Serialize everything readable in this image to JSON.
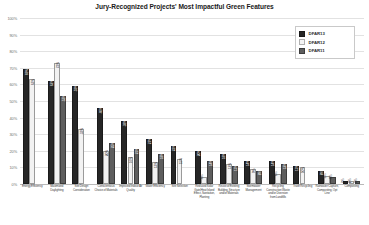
{
  "chart_data": {
    "type": "bar",
    "title": "Jury-Recognized Projects' Most Impactful Green Features",
    "xlabel": "",
    "ylabel": "",
    "ylim": [
      0,
      100
    ],
    "ytick_labels": [
      "100%",
      "90%",
      "80%",
      "70%",
      "60%",
      "50%",
      "40%",
      "30%",
      "20%",
      "10%",
      "0%"
    ],
    "ytick_values": [
      100,
      90,
      80,
      70,
      60,
      50,
      40,
      30,
      20,
      10,
      0
    ],
    "grid": true,
    "legend_position": "top-right",
    "categories": [
      "Energy Efficiency",
      "Maximized Daylighting",
      "Site Design Consideration",
      "Conscientious Choice of Materials",
      "Improved Indoor Air Quality",
      "Water Efficiency",
      "Site Selection",
      "Reduced Solar Gain/Heat Island Effect, Sanitation, Planting",
      "Reuse of Existing Building, Structure and/or Materials",
      "Stormwater Management",
      "Recycling Construction Waste and/or Diversion from Landfills",
      "Trash Recycling",
      "Rainwater Capture, Composting, Opt Line",
      "Composting"
    ],
    "series": [
      {
        "name": "DFAR13",
        "color": "#262626",
        "values": [
          69,
          62,
          59,
          46,
          38,
          27,
          23,
          20,
          18,
          14,
          14,
          11,
          8,
          2
        ],
        "labels": [
          "69%",
          "62%",
          "59%",
          "46%",
          "38%",
          "27%",
          "23%",
          "20%",
          "18%",
          "14%",
          "14%",
          "11%",
          "8%",
          "2%"
        ]
      },
      {
        "name": "DFAR12",
        "color": "#f2f2f2",
        "values": [
          63,
          73,
          33,
          20,
          16,
          13,
          15,
          4,
          12,
          9,
          6,
          10,
          5,
          2
        ],
        "labels": [
          "63%",
          "73%",
          "33%",
          "20%",
          "16%",
          "13%",
          "15%",
          "4%",
          "12%",
          "9%",
          "6%",
          "10%",
          "5%",
          "2%"
        ]
      },
      {
        "name": "DFAR11",
        "color": "#5e5e5e",
        "values": [
          0,
          53,
          0,
          25,
          21,
          18,
          0,
          14,
          11,
          8,
          12,
          0,
          4,
          2
        ],
        "labels": [
          "",
          "53%",
          "",
          "25%",
          "21%",
          "18%",
          "",
          "14%",
          "11%",
          "8%",
          "12%",
          "",
          "4%",
          "2%"
        ]
      }
    ]
  },
  "legend": {
    "items": [
      {
        "label": "DFAR13"
      },
      {
        "label": "DFAR12"
      },
      {
        "label": "DFAR11"
      }
    ]
  }
}
